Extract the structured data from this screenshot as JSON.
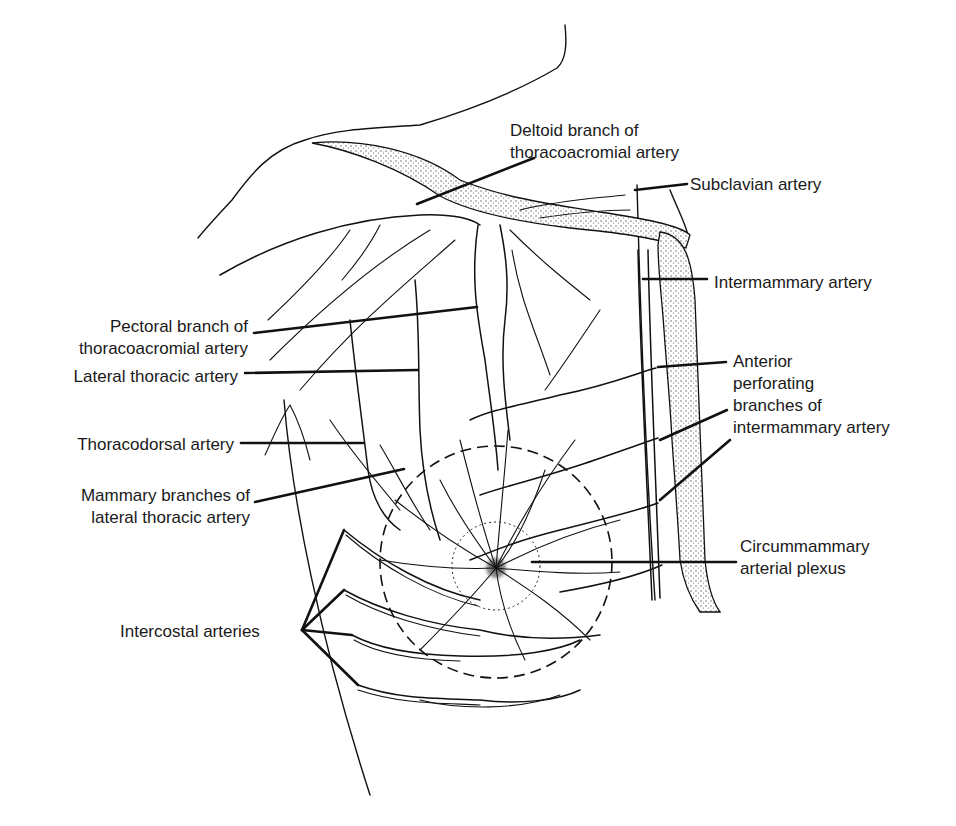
{
  "figure": {
    "colors": {
      "ink": "#111111",
      "background": "#ffffff",
      "stipple": "#9a9a9a"
    }
  },
  "labels": [
    {
      "id": "deltoid-branch",
      "lines": [
        "Deltoid branch of",
        "thoracoacromial artery"
      ],
      "x": 510,
      "y": 136,
      "anchor": "start",
      "leader": [
        [
          417,
          204
        ],
        [
          534,
          158
        ]
      ]
    },
    {
      "id": "subclavian",
      "lines": [
        "Subclavian artery"
      ],
      "x": 690,
      "y": 190,
      "anchor": "start",
      "leader": [
        [
          635,
          190
        ],
        [
          687,
          184
        ]
      ]
    },
    {
      "id": "intermammary",
      "lines": [
        "Intermammary artery"
      ],
      "x": 714,
      "y": 288,
      "anchor": "start",
      "leader": [
        [
          643,
          279
        ],
        [
          707,
          279
        ]
      ]
    },
    {
      "id": "anterior-perforating",
      "lines": [
        "Anterior",
        "perforating",
        "branches of",
        "intermammary artery"
      ],
      "x": 733,
      "y": 367,
      "anchor": "start",
      "leader": [
        [
          658,
          367
        ],
        [
          726,
          362
        ]
      ]
    },
    {
      "id": "pectoral-branch",
      "lines": [
        "Pectoral branch of",
        "thoracoacromial artery"
      ],
      "x": 248,
      "y": 332,
      "anchor": "end",
      "leader": [
        [
          254,
          333
        ],
        [
          477,
          307
        ]
      ]
    },
    {
      "id": "lateral-thoracic",
      "lines": [
        "Lateral thoracic artery"
      ],
      "x": 238,
      "y": 382,
      "anchor": "end",
      "leader": [
        [
          245,
          373
        ],
        [
          418,
          370
        ]
      ]
    },
    {
      "id": "thoracodorsal",
      "lines": [
        "Thoracodorsal artery"
      ],
      "x": 234,
      "y": 450,
      "anchor": "end",
      "leader": [
        [
          241,
          443
        ],
        [
          363,
          443
        ]
      ]
    },
    {
      "id": "mammary-branches",
      "lines": [
        "Mammary branches of",
        "lateral thoracic artery"
      ],
      "x": 250,
      "y": 501,
      "anchor": "end",
      "leader": [
        [
          255,
          502
        ],
        [
          404,
          469
        ]
      ]
    },
    {
      "id": "circummammary",
      "lines": [
        "Circummammary",
        "arterial plexus"
      ],
      "x": 740,
      "y": 552,
      "anchor": "start",
      "leader": [
        [
          532,
          562
        ],
        [
          736,
          562
        ]
      ]
    },
    {
      "id": "intercostal",
      "lines": [
        "Intercostal arteries"
      ],
      "x": 120,
      "y": 637,
      "anchor": "start",
      "leader_fan": {
        "origin": [
          302,
          630
        ],
        "targets": [
          [
            344,
            530
          ],
          [
            344,
            590
          ],
          [
            352,
            635
          ],
          [
            358,
            685
          ]
        ]
      }
    }
  ],
  "extra_leaders": [
    {
      "for": "anterior-perforating",
      "points": [
        [
          660,
          440
        ],
        [
          727,
          410
        ]
      ]
    },
    {
      "for": "anterior-perforating",
      "points": [
        [
          660,
          500
        ],
        [
          730,
          440
        ]
      ]
    }
  ]
}
